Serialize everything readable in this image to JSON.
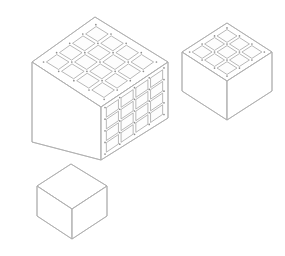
{
  "figure": {
    "background_color": "#ffffff",
    "stroke_color": "#b0b0b0",
    "stroke_color_dark": "#9a9a9a",
    "face_fill": "#ffffff",
    "tile_fill": "#fdfdfd",
    "dot_color": "#8e8e8e",
    "canvas": {
      "width": 285,
      "height": 256
    }
  },
  "objects": [
    {
      "id": "large-cube",
      "label": "large gridded cube",
      "grid_rows": 4,
      "grid_cols": 4,
      "gridded_faces": [
        "top",
        "right"
      ],
      "geometry": {
        "top_vertex": {
          "x": 95,
          "y": 17
        },
        "left_vertex": {
          "x": 32,
          "y": 62
        },
        "right_vertex": {
          "x": 168,
          "y": 62
        },
        "front_vertex": {
          "x": 101,
          "y": 107
        },
        "left_bottom": {
          "x": 32,
          "y": 142
        },
        "right_bottom": {
          "x": 168,
          "y": 118
        },
        "front_bottom": {
          "x": 101,
          "y": 160
        }
      },
      "tile_count_top": 16,
      "tile_count_right": 16
    },
    {
      "id": "medium-cube",
      "label": "medium cube with 3x3 top grid",
      "grid_rows": 3,
      "grid_cols": 3,
      "gridded_faces": [
        "top"
      ],
      "geometry": {
        "top_vertex": {
          "x": 227,
          "y": 23
        },
        "left_vertex": {
          "x": 182,
          "y": 52
        },
        "right_vertex": {
          "x": 272,
          "y": 52
        },
        "front_vertex": {
          "x": 227,
          "y": 81
        },
        "left_bottom": {
          "x": 182,
          "y": 91
        },
        "right_bottom": {
          "x": 272,
          "y": 91
        },
        "front_bottom": {
          "x": 227,
          "y": 120
        }
      },
      "tile_count_top": 9
    },
    {
      "id": "small-cube",
      "label": "plain small cube",
      "grid_rows": 0,
      "grid_cols": 0,
      "gridded_faces": [],
      "geometry": {
        "top_vertex": {
          "x": 71,
          "y": 164
        },
        "left_vertex": {
          "x": 37,
          "y": 186
        },
        "right_vertex": {
          "x": 107,
          "y": 186
        },
        "front_vertex": {
          "x": 72,
          "y": 209
        },
        "left_bottom": {
          "x": 37,
          "y": 216
        },
        "right_bottom": {
          "x": 107,
          "y": 216
        },
        "front_bottom": {
          "x": 72,
          "y": 239
        }
      },
      "tile_count_top": 0
    }
  ]
}
